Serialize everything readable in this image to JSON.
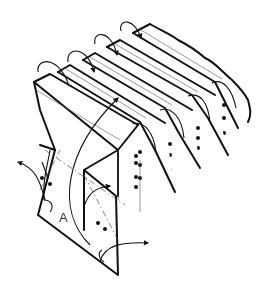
{
  "figure": {
    "type": "pleated filter / folded media isometric line drawing",
    "labels": {
      "region_a": "A"
    },
    "pleat_count": 5,
    "colors": {
      "line": "#111111",
      "background": "#ffffff"
    }
  }
}
